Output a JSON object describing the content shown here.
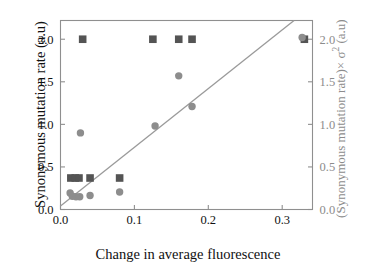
{
  "chart_data": {
    "type": "scatter",
    "title": "",
    "xlabel": "Change in average fluorescence",
    "ylabel": "Synonymous mutation rate (a.u)",
    "ylabel_right_parts": {
      "pre": "(Synonymous mutation rate)× σ",
      "sup": "2",
      "post": " (a.u)"
    },
    "ylabel_right": "(Synonymous mutation rate)× σ2 (a.u)",
    "xlim": [
      0.0,
      0.341
    ],
    "ylim": [
      0.0,
      2.22
    ],
    "ylim_right": [
      0.0,
      2.22
    ],
    "xticks": [
      0.0,
      0.1,
      0.2,
      0.3
    ],
    "xticklabels": [
      "0.0",
      "0.1",
      "0.2",
      "0.3"
    ],
    "yticks": [
      0.0,
      0.5,
      1.0,
      1.5,
      2.0
    ],
    "yticklabels": [
      "0.0",
      "0.5",
      "1.0",
      "1.5",
      "2.0"
    ],
    "yticks_right": [
      0.0,
      0.5,
      1.0,
      1.5,
      2.0
    ],
    "yticklabels_right": [
      "0.0",
      "0.5",
      "1.0",
      "1.5",
      "2.0"
    ],
    "grid": false,
    "legend": "none",
    "series": [
      {
        "name": "Synonymous mutation rate (a.u)",
        "marker": "square",
        "color": "#545454",
        "axis": "left",
        "points": [
          {
            "x": 0.03,
            "y": 2.0
          },
          {
            "x": 0.125,
            "y": 2.0
          },
          {
            "x": 0.16,
            "y": 2.0
          },
          {
            "x": 0.178,
            "y": 2.0
          },
          {
            "x": 0.33,
            "y": 2.0
          },
          {
            "x": 0.014,
            "y": 0.37
          },
          {
            "x": 0.02,
            "y": 0.37
          },
          {
            "x": 0.025,
            "y": 0.37
          },
          {
            "x": 0.04,
            "y": 0.37
          },
          {
            "x": 0.08,
            "y": 0.37
          }
        ]
      },
      {
        "name": "(Synonymous mutation rate)× σ2 (a.u)",
        "marker": "circle",
        "color": "#8d8d8d",
        "axis": "right",
        "points": [
          {
            "x": 0.327,
            "y": 2.02
          },
          {
            "x": 0.16,
            "y": 1.57
          },
          {
            "x": 0.178,
            "y": 1.21
          },
          {
            "x": 0.128,
            "y": 0.98
          },
          {
            "x": 0.027,
            "y": 0.9
          },
          {
            "x": 0.08,
            "y": 0.205
          },
          {
            "x": 0.04,
            "y": 0.165
          },
          {
            "x": 0.026,
            "y": 0.15
          },
          {
            "x": 0.021,
            "y": 0.15
          },
          {
            "x": 0.016,
            "y": 0.155
          },
          {
            "x": 0.013,
            "y": 0.195
          }
        ]
      }
    ],
    "trendline": {
      "name": "linear-fit-line",
      "color": "#9a9a9a",
      "x_start": 0.0,
      "y_start": 0.04,
      "x_end": 0.316,
      "y_end": 2.22
    }
  }
}
